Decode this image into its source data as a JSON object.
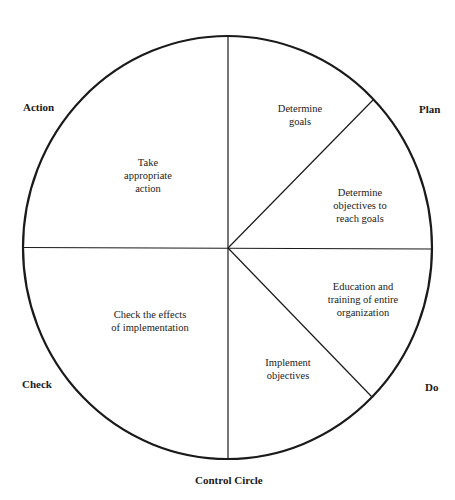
{
  "diagram": {
    "title": "Control Circle",
    "stroke_color": "#1a1a1a",
    "circle": {
      "cx": 227.5,
      "cy": 247.5,
      "rx": 204.5,
      "ry": 211.5
    },
    "phases": {
      "action": "Action",
      "plan": "Plan",
      "do": "Do",
      "check": "Check"
    },
    "segments": [
      {
        "id": "determine-goals",
        "phase": "Plan",
        "text": "Determine\ngoals"
      },
      {
        "id": "determine-objectives",
        "phase": "Plan",
        "text": "Determine\nobjectives to\nreach goals"
      },
      {
        "id": "education-training",
        "phase": "Do",
        "text": "Education and\ntraining of entire\norganization"
      },
      {
        "id": "implement-objectives",
        "phase": "Do",
        "text": "Implement\nobjectives"
      },
      {
        "id": "check-effects",
        "phase": "Check",
        "text": "Check the effects\nof implementation"
      },
      {
        "id": "take-action",
        "phase": "Action",
        "text": "Take\nappropriate\naction"
      }
    ]
  }
}
